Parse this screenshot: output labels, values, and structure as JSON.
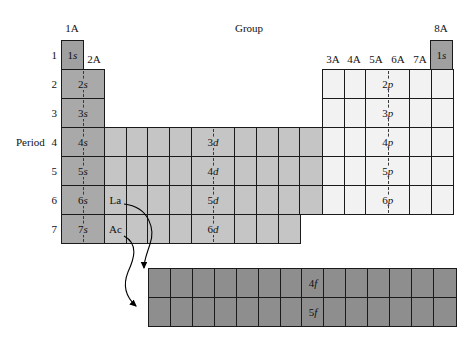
{
  "labels": {
    "group": "Group",
    "period": "Period",
    "col_1a": "1A",
    "col_2a": "2A",
    "col_8a": "8A"
  },
  "p_headers": [
    "3A",
    "4A",
    "5A",
    "6A",
    "7A"
  ],
  "period_numbers": [
    "1",
    "2",
    "3",
    "4",
    "5",
    "6",
    "7"
  ],
  "orbitals": {
    "s1_left": "1s",
    "s1_right": "1s",
    "s_rows": [
      "2s",
      "3s",
      "4s",
      "5s",
      "6s",
      "7s"
    ],
    "d_rows": [
      "3d",
      "4d",
      "5d",
      "6d"
    ],
    "p_rows": [
      "2p",
      "3p",
      "4p",
      "5p",
      "6p"
    ],
    "f_rows": [
      "4f",
      "5f"
    ]
  },
  "elements": {
    "la": "La",
    "ac": "Ac"
  },
  "colors": {
    "s_block": "#a9a9a9",
    "one_s_cells": "#a0a0a0",
    "d_block": "#c5c5c5",
    "p_block": "#f2f2f2",
    "f_block": "#8e8e8e",
    "grid_line": "#1a1a1a"
  }
}
